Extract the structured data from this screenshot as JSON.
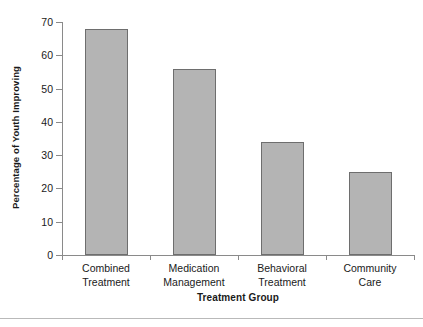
{
  "chart_data": {
    "type": "bar",
    "title": "",
    "xlabel": "Treatment Group",
    "ylabel": "Percentage of Youth Improving",
    "categories": [
      "Combined Treatment",
      "Medication Management",
      "Behavioral Treatment",
      "Community Care"
    ],
    "category_lines": [
      [
        "Combined",
        "Treatment"
      ],
      [
        "Medication",
        "Management"
      ],
      [
        "Behavioral",
        "Treatment"
      ],
      [
        "Community",
        "Care"
      ]
    ],
    "values": [
      68,
      56,
      34,
      25
    ],
    "ylim": [
      0,
      70
    ],
    "yticks": [
      0,
      10,
      20,
      30,
      40,
      50,
      60,
      70
    ],
    "ytick_labels": [
      "0",
      "10",
      "20",
      "30",
      "40",
      "50",
      "60",
      "70"
    ],
    "grid": false,
    "legend": null,
    "bar_color": "#b4b4b4",
    "bar_border_color": "#6e6e6e",
    "axis_color": "#8a8a8a",
    "text_color": "#1a1a1a"
  }
}
